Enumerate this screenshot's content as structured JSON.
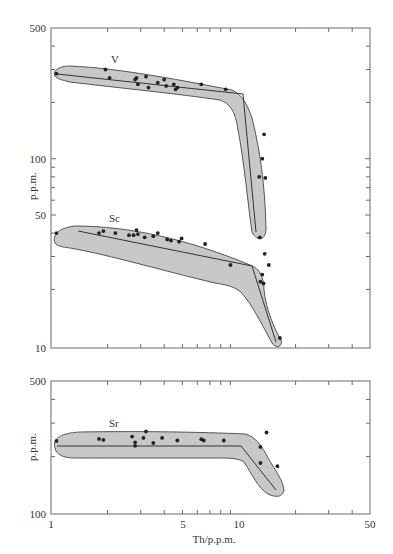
{
  "chart_data": [
    {
      "type": "scatter",
      "panel": "top",
      "title": "",
      "xlabel": "",
      "ylabel": "p.p.m.",
      "xscale": "log",
      "yscale": "log",
      "xlim": [
        1,
        50
      ],
      "ylim": [
        10,
        500
      ],
      "x_ticks": [
        1,
        5,
        10,
        50
      ],
      "y_ticks": [
        500,
        100,
        50,
        10
      ],
      "grid": false,
      "series": [
        {
          "name": "V",
          "points": [
            [
              1.07,
              285
            ],
            [
              1.95,
              300
            ],
            [
              2.05,
              270
            ],
            [
              2.8,
              265
            ],
            [
              2.85,
              270
            ],
            [
              2.9,
              250
            ],
            [
              3.2,
              275
            ],
            [
              3.3,
              240
            ],
            [
              3.7,
              255
            ],
            [
              4.0,
              265
            ],
            [
              4.1,
              245
            ],
            [
              4.5,
              250
            ],
            [
              4.6,
              235
            ],
            [
              4.7,
              240
            ],
            [
              6.3,
              250
            ],
            [
              8.5,
              235
            ],
            [
              13.6,
              135
            ],
            [
              13.3,
              100
            ],
            [
              12.8,
              80
            ],
            [
              13.8,
              79
            ],
            [
              12.9,
              38
            ]
          ],
          "trend": [
            [
              1.07,
              285
            ],
            [
              10.5,
              235
            ],
            [
              14.0,
              37
            ]
          ],
          "envelope_color": "#c8c8c8"
        },
        {
          "name": "Sc",
          "points": [
            [
              1.07,
              40
            ],
            [
              1.8,
              40
            ],
            [
              1.9,
              41
            ],
            [
              2.2,
              40
            ],
            [
              2.6,
              39
            ],
            [
              2.75,
              39
            ],
            [
              2.85,
              41.5
            ],
            [
              2.9,
              39.5
            ],
            [
              3.15,
              38
            ],
            [
              3.5,
              38.5
            ],
            [
              3.7,
              40
            ],
            [
              4.15,
              37
            ],
            [
              4.35,
              36.5
            ],
            [
              4.8,
              36
            ],
            [
              4.95,
              37.5
            ],
            [
              6.6,
              35
            ],
            [
              9.0,
              27
            ],
            [
              13.7,
              31
            ],
            [
              14.4,
              27
            ],
            [
              13.3,
              24
            ],
            [
              13.0,
              22
            ],
            [
              13.5,
              21.5
            ],
            [
              16.5,
              11
            ]
          ],
          "trend": [
            [
              1.5,
              44
            ],
            [
              11.5,
              31
            ],
            [
              16.5,
              11
            ]
          ],
          "envelope_color": "#c8c8c8"
        }
      ]
    },
    {
      "type": "scatter",
      "panel": "bottom",
      "title": "",
      "xlabel": "Th/p.p.m.",
      "ylabel": "p.p.m.",
      "xscale": "log",
      "yscale": "log",
      "xlim": [
        1,
        50
      ],
      "ylim": [
        100,
        500
      ],
      "x_ticks": [
        1,
        5,
        10,
        50
      ],
      "y_ticks": [
        500,
        100
      ],
      "grid": false,
      "series": [
        {
          "name": "Sr",
          "points": [
            [
              1.07,
              242
            ],
            [
              1.8,
              248
            ],
            [
              1.9,
              245
            ],
            [
              2.7,
              255
            ],
            [
              2.8,
              238
            ],
            [
              2.8,
              228
            ],
            [
              3.1,
              251
            ],
            [
              3.2,
              271
            ],
            [
              3.5,
              236
            ],
            [
              3.9,
              251
            ],
            [
              4.7,
              243
            ],
            [
              6.3,
              247
            ],
            [
              6.5,
              243
            ],
            [
              8.3,
              243
            ],
            [
              13.0,
              225
            ],
            [
              13.0,
              185
            ],
            [
              14.0,
              268
            ],
            [
              16.0,
              178
            ]
          ],
          "trend": [
            [
              1.07,
              249
            ],
            [
              10.5,
              249
            ],
            [
              16.0,
              178
            ]
          ],
          "envelope_color": "#c8c8c8"
        }
      ]
    }
  ],
  "labels": {
    "top_ylabel": "p.p.m.",
    "bottom_ylabel": "p.p.m.",
    "xlabel": "Th/p.p.m.",
    "series_V": "V",
    "series_Sc": "Sc",
    "series_Sr": "Sr",
    "top_yticks": [
      "500",
      "100",
      "50",
      "10"
    ],
    "bottom_yticks": [
      "500",
      "100"
    ],
    "xticks": [
      "1",
      "5",
      "10",
      "50"
    ]
  }
}
